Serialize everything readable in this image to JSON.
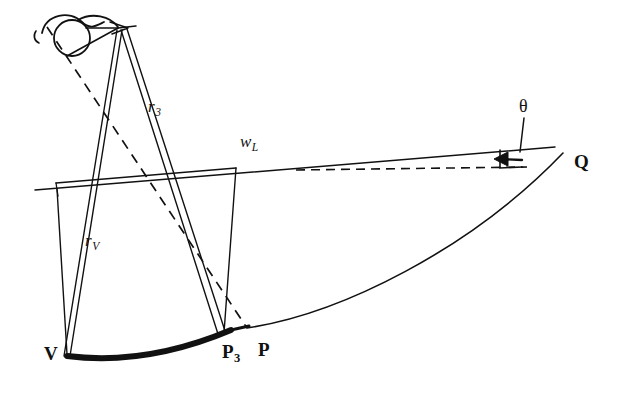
{
  "figure": {
    "kind": "line-diagram",
    "background_color": "#ffffff",
    "ink_color": "#111111",
    "width": 617,
    "height": 393
  },
  "labels": {
    "r3": {
      "base": "r",
      "subscript": "3",
      "x": 148,
      "y": 98
    },
    "rV": {
      "base": "r",
      "subscript": "V",
      "x": 85,
      "y": 232
    },
    "wL": {
      "base": "w",
      "subscript": "L",
      "x": 240,
      "y": 133
    },
    "theta": {
      "text": "θ",
      "x": 519,
      "y": 97
    },
    "V": {
      "text": "V",
      "x": 44,
      "y": 344
    },
    "P3": {
      "base": "P",
      "subscript": "3",
      "x": 222,
      "y": 342
    },
    "P": {
      "text": "P",
      "x": 258,
      "y": 340
    },
    "Q": {
      "text": "Q",
      "x": 574,
      "y": 152
    }
  },
  "points": {
    "apex": {
      "x": 118,
      "y": 28
    },
    "V": {
      "x": 67,
      "y": 355
    },
    "P3": {
      "x": 222,
      "y": 332
    },
    "P": {
      "x": 247,
      "y": 327
    },
    "Q": {
      "x": 563,
      "y": 153
    },
    "circle_center": {
      "x": 72,
      "y": 38
    },
    "circle_radius": 18
  },
  "elements": {
    "thick_arc_label": "baseline-arc-V-to-P3",
    "thin_curve_label": "curve-P-to-Q",
    "dashed_ray_label": "dashed-ray-to-P",
    "dashed_horizontal_label": "dashed-horizontal-reference",
    "wedge_rV_label": "wedge-apex-to-V",
    "wedge_r3_label": "wedge-apex-to-P3",
    "angle_arrow_label": "theta-angle-arrow"
  }
}
